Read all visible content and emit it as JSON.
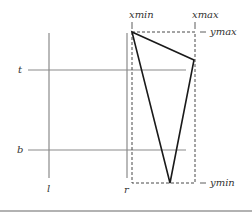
{
  "diagram": {
    "labels": {
      "t": "t",
      "b": "b",
      "l": "l",
      "r": "r",
      "xmin": "xmin",
      "xmax": "xmax",
      "ymin": "ymin",
      "ymax": "ymax"
    },
    "colors": {
      "window_lines": "#8a8a8a",
      "triangle": "#1a1a1a",
      "bbox": "#333333",
      "rule": "#666666"
    }
  }
}
